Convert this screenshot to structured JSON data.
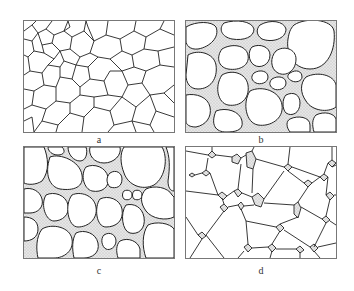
{
  "figure": {
    "panels": [
      {
        "id": "a",
        "label": "a",
        "description": "Polygonal grain network, fine and coarse grains, no intergranular phase"
      },
      {
        "id": "b",
        "label": "b",
        "description": "Rounded grains separated by thick stippled liquid/intergranular phase"
      },
      {
        "id": "c",
        "label": "c",
        "description": "Faceted rounded grains with stippled phase at triple junctions and some boundaries"
      },
      {
        "id": "d",
        "label": "d",
        "description": "Polygonal grains with stippled pockets only at triple junctions"
      }
    ],
    "colors": {
      "line": "#222222",
      "border": "#777777",
      "stipple": "#d8d8d8",
      "background": "#ffffff"
    }
  }
}
